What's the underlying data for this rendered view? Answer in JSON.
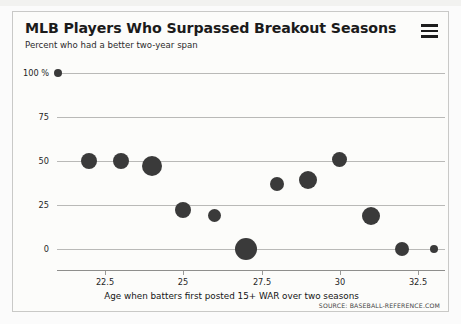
{
  "card": {
    "title": "MLB Players Who Surpassed Breakout Seasons",
    "subtitle": "Percent who had a better two-year span",
    "menu_icon": "hamburger-menu-icon",
    "menu_label": "Chart context menu"
  },
  "chart_data": {
    "type": "scatter",
    "title": "MLB Players Who Surpassed Breakout Seasons",
    "subtitle": "Percent who had a better two-year span",
    "xlabel": "Age when batters first posted 15+ WAR over two seasons",
    "ylabel": "Percent who had a better two-year span",
    "xlim": [
      20.3,
      33.6
    ],
    "ylim": [
      -6,
      104
    ],
    "xticks": [
      22.5,
      25,
      27.5,
      30,
      32.5
    ],
    "xtick_labels": [
      "22.5",
      "25",
      "27.5",
      "30",
      "32.5"
    ],
    "yticks": [
      0,
      25,
      50,
      75,
      100
    ],
    "ytick_labels": [
      "0",
      "25",
      "50",
      "75",
      "100 %"
    ],
    "grid": "horizontal",
    "legend": "none",
    "marker_color": "#3a3a3a",
    "source": "SOURCE: BASEBALL-REFERENCE.COM",
    "points": [
      {
        "x": 21.0,
        "y": 100,
        "size": 4.0
      },
      {
        "x": 22.0,
        "y": 50,
        "size": 8.0
      },
      {
        "x": 23.0,
        "y": 50,
        "size": 8.0
      },
      {
        "x": 24.0,
        "y": 47,
        "size": 10.0
      },
      {
        "x": 25.0,
        "y": 22,
        "size": 8.0
      },
      {
        "x": 26.0,
        "y": 19,
        "size": 6.5
      },
      {
        "x": 27.0,
        "y": 0,
        "size": 11.0
      },
      {
        "x": 28.0,
        "y": 37,
        "size": 7.0
      },
      {
        "x": 29.0,
        "y": 39,
        "size": 9.0
      },
      {
        "x": 30.0,
        "y": 51,
        "size": 7.5
      },
      {
        "x": 31.0,
        "y": 19,
        "size": 9.0
      },
      {
        "x": 32.0,
        "y": 0,
        "size": 7.0
      },
      {
        "x": 33.0,
        "y": 0,
        "size": 4.0
      }
    ]
  },
  "footer": {
    "axis_title": "Age when batters first posted 15+ WAR over two seasons",
    "source": "SOURCE: BASEBALL-REFERENCE.COM"
  }
}
